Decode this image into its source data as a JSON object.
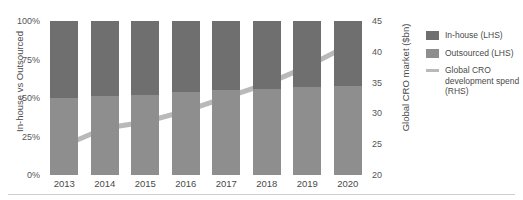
{
  "chart_data": {
    "type": "bar",
    "title": "",
    "subtitle": "",
    "categories": [
      "2013",
      "2014",
      "2015",
      "2016",
      "2017",
      "2018",
      "2019",
      "2020"
    ],
    "xlabel": "",
    "ylabel": "In-house vs Outsourced",
    "ylabel_secondary": "Global CRO market ($bn)",
    "ylim": [
      0,
      100
    ],
    "ylim_secondary": [
      20,
      45
    ],
    "ytick_labels": [
      "0%",
      "25%",
      "50%",
      "75%",
      "100%"
    ],
    "ytick_values": [
      0,
      25,
      50,
      75,
      100
    ],
    "ytick_labels_secondary": [
      "20",
      "25",
      "30",
      "35",
      "40",
      "45"
    ],
    "ytick_values_secondary": [
      20,
      25,
      30,
      35,
      40,
      45
    ],
    "grid": false,
    "legend_position": "right",
    "stacked": true,
    "series": [
      {
        "name": "In-house (LHS)",
        "type": "bar",
        "axis": "left",
        "color": "#6f6f6f",
        "values": [
          50,
          49,
          48,
          46,
          45,
          44,
          43,
          42
        ]
      },
      {
        "name": "Outsourced (LHS)",
        "type": "bar",
        "axis": "left",
        "color": "#8e8e8e",
        "values": [
          50,
          51,
          52,
          54,
          55,
          56,
          57,
          58
        ]
      },
      {
        "name": "Global CRO development spend (RHS)",
        "type": "line",
        "axis": "right",
        "color": "#b9b9b9",
        "values": [
          24.8,
          27.6,
          28.6,
          30.4,
          32.6,
          34.8,
          37.6,
          41.0
        ]
      }
    ]
  },
  "axes": {
    "left_title": "In-house vs Outsourced",
    "right_title": "Global CRO market ($bn)"
  },
  "legend": {
    "items": [
      {
        "label": "In-house (LHS)",
        "swatch": "square-swatch-dark",
        "color": "#6f6f6f"
      },
      {
        "label": "Outsourced (LHS)",
        "swatch": "square-swatch-mid",
        "color": "#8e8e8e"
      },
      {
        "label": "Global CRO development spend (RHS)",
        "swatch": "line-swatch",
        "color": "#b9b9b9"
      }
    ]
  }
}
